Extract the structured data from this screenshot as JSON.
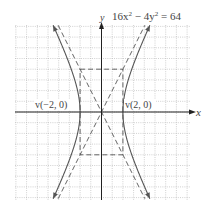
{
  "figure": {
    "equation": "16x² − 4y² = 64",
    "equation_parts": {
      "a": "16x",
      "a_sup": "2",
      "mid": " − 4y",
      "b_sup": "2",
      "rhs": " = 64"
    },
    "x_axis_label": "x",
    "y_axis_label": "y",
    "vertex_left_label": "v(−2, 0)",
    "vertex_right_label": "v(2, 0)",
    "colors": {
      "curve": "#555555",
      "axis": "#222222",
      "grid": "#b0b0b0",
      "text": "#444444"
    }
  },
  "chart_data": {
    "type": "line",
    "xlabel": "x",
    "ylabel": "y",
    "xlim": [
      -8,
      8
    ],
    "ylim": [
      -8,
      8
    ],
    "grid": true,
    "series": [
      {
        "name": "hyperbola right branch",
        "equation": "x = 2*sqrt(1 + y^2/16)",
        "vertex": [
          2,
          0
        ]
      },
      {
        "name": "hyperbola left branch",
        "equation": "x = -2*sqrt(1 + y^2/16)",
        "vertex": [
          -2,
          0
        ]
      },
      {
        "name": "asymptote",
        "equation": "y = 2x",
        "style": "dashed"
      },
      {
        "name": "asymptote",
        "equation": "y = -2x",
        "style": "dashed"
      },
      {
        "name": "central rectangle",
        "corners": [
          [
            -2,
            4
          ],
          [
            2,
            4
          ],
          [
            2,
            -4
          ],
          [
            -2,
            -4
          ]
        ],
        "style": "dashed"
      }
    ],
    "annotations": [
      {
        "text": "v(−2, 0)",
        "at": [
          -2,
          0
        ]
      },
      {
        "text": "v(2, 0)",
        "at": [
          2,
          0
        ]
      }
    ]
  }
}
